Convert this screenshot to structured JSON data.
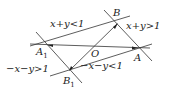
{
  "diagram": {
    "points": {
      "A": {
        "label": "A",
        "x": 137,
        "y": 48
      },
      "A1": {
        "label": "A",
        "sub": "1",
        "x": 49,
        "y": 45
      },
      "B": {
        "label": "B",
        "x": 117,
        "y": 24
      },
      "B1": {
        "label": "B",
        "sub": "1",
        "x": 70,
        "y": 70
      },
      "O": {
        "label": "O",
        "x": 96,
        "y": 47
      }
    },
    "regions": {
      "top_left": "x+y<1",
      "top_right": "x+y>1",
      "bottom_left": "−x−y>1",
      "bottom_right": "−x−y<1"
    },
    "colors": {
      "line": "#333333",
      "text": "#222222"
    }
  }
}
